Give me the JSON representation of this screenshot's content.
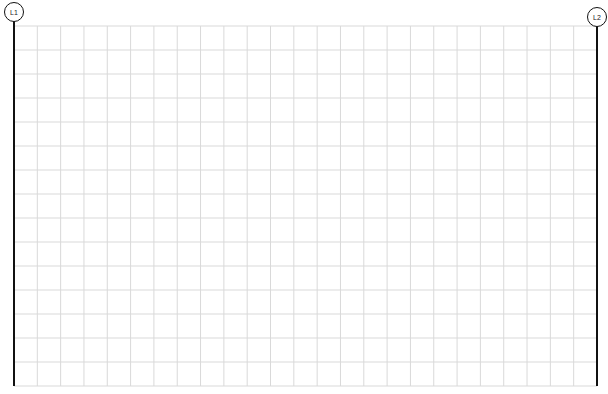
{
  "diagram": {
    "type": "structural-grid",
    "grid": {
      "left": 14,
      "top": 26,
      "right": 597,
      "bottom": 386,
      "columns": 25,
      "rows": 15,
      "line_color": "#d9d9d9"
    },
    "grid_lines": [
      {
        "id": "L1",
        "label": "L1",
        "x": 14
      },
      {
        "id": "L2",
        "label": "L2",
        "x": 597
      }
    ],
    "axis_color": "#111111"
  }
}
